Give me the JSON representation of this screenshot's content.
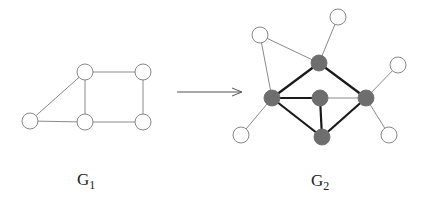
{
  "colors": {
    "background": "#ffffff",
    "edge_thin": "#8a8a8a",
    "edge_thick": "#1a1a1a",
    "node_fill_white": "#ffffff",
    "node_fill_gray": "#6e6e6e",
    "node_stroke": "#7a7a7a",
    "arrow": "#555555"
  },
  "graphs": [
    {
      "id": "G1",
      "label": {
        "base": "G",
        "sub": "1",
        "x": 77,
        "y": 171
      },
      "nodes": [
        {
          "id": "a",
          "x": 30,
          "y": 121,
          "fill": "white"
        },
        {
          "id": "b",
          "x": 85,
          "y": 72,
          "fill": "white"
        },
        {
          "id": "c",
          "x": 143,
          "y": 72,
          "fill": "white"
        },
        {
          "id": "d",
          "x": 85,
          "y": 122,
          "fill": "white"
        },
        {
          "id": "e",
          "x": 143,
          "y": 122,
          "fill": "white"
        }
      ],
      "edges": [
        {
          "from": "a",
          "to": "b",
          "style": "thin"
        },
        {
          "from": "a",
          "to": "d",
          "style": "thin"
        },
        {
          "from": "b",
          "to": "c",
          "style": "thin"
        },
        {
          "from": "b",
          "to": "d",
          "style": "thin"
        },
        {
          "from": "c",
          "to": "e",
          "style": "thin"
        },
        {
          "from": "d",
          "to": "e",
          "style": "thin"
        }
      ]
    },
    {
      "id": "G2",
      "label": {
        "base": "G",
        "sub": "2",
        "x": 311,
        "y": 172
      },
      "nodes": [
        {
          "id": "w1",
          "x": 260,
          "y": 35,
          "fill": "white"
        },
        {
          "id": "w2",
          "x": 338,
          "y": 17,
          "fill": "white"
        },
        {
          "id": "g1",
          "x": 319,
          "y": 63,
          "fill": "gray"
        },
        {
          "id": "w3",
          "x": 398,
          "y": 65,
          "fill": "white"
        },
        {
          "id": "g2",
          "x": 272,
          "y": 98,
          "fill": "gray"
        },
        {
          "id": "g3",
          "x": 320,
          "y": 98,
          "fill": "gray"
        },
        {
          "id": "g4",
          "x": 366,
          "y": 98,
          "fill": "gray"
        },
        {
          "id": "w4",
          "x": 241,
          "y": 135,
          "fill": "white"
        },
        {
          "id": "g5",
          "x": 322,
          "y": 137,
          "fill": "gray"
        },
        {
          "id": "w5",
          "x": 389,
          "y": 135,
          "fill": "white"
        }
      ],
      "edges": [
        {
          "from": "w1",
          "to": "g1",
          "style": "thin"
        },
        {
          "from": "w1",
          "to": "g2",
          "style": "thin"
        },
        {
          "from": "w2",
          "to": "g1",
          "style": "thin"
        },
        {
          "from": "w3",
          "to": "g4",
          "style": "thin"
        },
        {
          "from": "w4",
          "to": "g2",
          "style": "thin"
        },
        {
          "from": "w5",
          "to": "g4",
          "style": "thin"
        },
        {
          "from": "g3",
          "to": "g4",
          "style": "thin"
        },
        {
          "from": "g1",
          "to": "g2",
          "style": "thick"
        },
        {
          "from": "g1",
          "to": "g4",
          "style": "thick"
        },
        {
          "from": "g2",
          "to": "g3",
          "style": "thick"
        },
        {
          "from": "g2",
          "to": "g5",
          "style": "thick"
        },
        {
          "from": "g3",
          "to": "g5",
          "style": "thick"
        },
        {
          "from": "g4",
          "to": "g5",
          "style": "thick"
        }
      ]
    }
  ],
  "arrow": {
    "x1": 177,
    "y1": 92,
    "x2": 242,
    "y2": 92
  },
  "node_radius": 8
}
